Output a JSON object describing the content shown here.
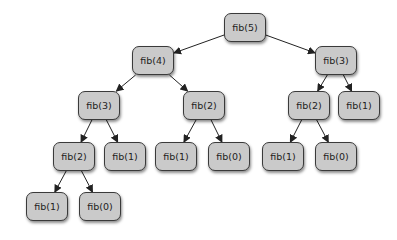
{
  "diagram": {
    "title": "",
    "nodes": [
      {
        "id": "n5",
        "label": "fib(5)",
        "x": 224,
        "y": 13
      },
      {
        "id": "n4",
        "label": "fib(4)",
        "x": 132,
        "y": 46
      },
      {
        "id": "n3r",
        "label": "fib(3)",
        "x": 315,
        "y": 46
      },
      {
        "id": "n3l",
        "label": "fib(3)",
        "x": 78,
        "y": 91
      },
      {
        "id": "n2a",
        "label": "fib(2)",
        "x": 183,
        "y": 91
      },
      {
        "id": "n2r",
        "label": "fib(2)",
        "x": 288,
        "y": 91
      },
      {
        "id": "n1r",
        "label": "fib(1)",
        "x": 338,
        "y": 91
      },
      {
        "id": "n2l",
        "label": "fib(2)",
        "x": 53,
        "y": 142
      },
      {
        "id": "n1a",
        "label": "fib(1)",
        "x": 104,
        "y": 142
      },
      {
        "id": "n1b",
        "label": "fib(1)",
        "x": 155,
        "y": 142
      },
      {
        "id": "n0a",
        "label": "fib(0)",
        "x": 208,
        "y": 142
      },
      {
        "id": "n1c",
        "label": "fib(1)",
        "x": 262,
        "y": 142
      },
      {
        "id": "n0b",
        "label": "fib(0)",
        "x": 315,
        "y": 142
      },
      {
        "id": "n1d",
        "label": "fib(1)",
        "x": 26,
        "y": 192
      },
      {
        "id": "n0c",
        "label": "fib(0)",
        "x": 79,
        "y": 192
      }
    ],
    "edges": [
      [
        "n5",
        "n4"
      ],
      [
        "n5",
        "n3r"
      ],
      [
        "n4",
        "n3l"
      ],
      [
        "n4",
        "n2a"
      ],
      [
        "n3r",
        "n2r"
      ],
      [
        "n3r",
        "n1r"
      ],
      [
        "n3l",
        "n2l"
      ],
      [
        "n3l",
        "n1a"
      ],
      [
        "n2a",
        "n1b"
      ],
      [
        "n2a",
        "n0a"
      ],
      [
        "n2r",
        "n1c"
      ],
      [
        "n2r",
        "n0b"
      ],
      [
        "n2l",
        "n1d"
      ],
      [
        "n2l",
        "n0c"
      ]
    ]
  }
}
